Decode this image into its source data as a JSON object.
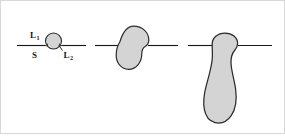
{
  "figure": {
    "background_color": "#ffffff",
    "line_color": "#1a1a1a",
    "shape_fill_color": "#d4d4d4",
    "shape_stroke_color": "#2b2b2b",
    "border_color": "#cccccc",
    "panels": [
      {
        "id": "panel-1",
        "name": "small-droplet-stage",
        "shape": "circle",
        "labels": [
          {
            "id": "label-l1",
            "base": "L",
            "sub": "1",
            "full": "L₁"
          },
          {
            "id": "label-s",
            "base": "S",
            "sub": "",
            "full": "S"
          },
          {
            "id": "label-l2",
            "base": "L",
            "sub": "2",
            "full": "L₂"
          }
        ]
      },
      {
        "id": "panel-2",
        "name": "medium-blob-stage",
        "shape": "blob",
        "labels": []
      },
      {
        "id": "panel-3",
        "name": "large-pendant-stage",
        "shape": "pendant",
        "labels": []
      }
    ]
  }
}
